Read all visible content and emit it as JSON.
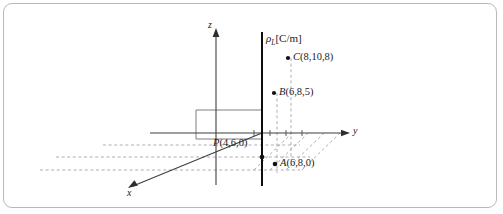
{
  "figure": {
    "kind": "3d-coordinate-diagram",
    "border_color": "#b9b9b9",
    "background": "#ffffff",
    "axes": {
      "z_label": "z",
      "y_label": "y",
      "x_label": "x"
    },
    "charge_line": {
      "label_rho": "ρ",
      "label_subscript": "L",
      "label_units": "[C/m]",
      "full_label": "ρL[C/m]",
      "color": "#000000"
    },
    "points": [
      {
        "name": "C",
        "coords": "(8,10,8)",
        "label": "C(8,10,8)"
      },
      {
        "name": "B",
        "coords": "(6,8,5)",
        "label": "B(6,8,5)"
      },
      {
        "name": "P",
        "coords": "(4,6,0)",
        "label": "P(4,6,0)"
      },
      {
        "name": "A",
        "coords": "(6,8,0)",
        "label": "A(6,8,0)"
      }
    ],
    "line_colors": {
      "axis": "#4a4a4a",
      "dashed_guide": "#8d8d8d",
      "charge": "#000000"
    }
  }
}
